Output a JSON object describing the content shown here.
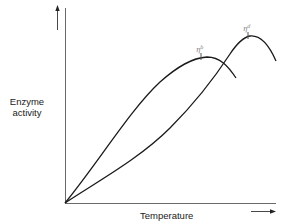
{
  "diagram": {
    "y_axis_label_line1": "Enzyme",
    "y_axis_label_line2": "activity",
    "x_axis_label": "Temperature",
    "curves": [
      {
        "name": "curve-b",
        "label_base": "η",
        "label_sup": "b",
        "color": "#1a1a1a",
        "description": "Lower optimum temperature; activity peaks then falls"
      },
      {
        "name": "curve-d",
        "label_base": "η",
        "label_sup": "d",
        "color": "#1a1a1a",
        "description": "Higher optimum temperature; peaks higher and later then falls"
      }
    ],
    "axis_color": "#555555",
    "line_color": "#1a1a1a"
  }
}
